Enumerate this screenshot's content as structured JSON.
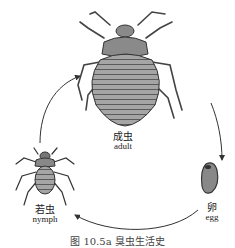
{
  "figure": {
    "caption": "图 10.5a   臭虫生活史",
    "stages": [
      {
        "id": "adult",
        "label_zh": "成虫",
        "label_en": "adult"
      },
      {
        "id": "egg",
        "label_zh": "卵",
        "label_en": "egg"
      },
      {
        "id": "nymph",
        "label_zh": "若虫",
        "label_en": "nymph"
      }
    ],
    "cycle_order": [
      "nymph",
      "adult",
      "egg",
      "nymph"
    ],
    "colors": {
      "line": "#333333",
      "body_fill": "#9a9a9a",
      "stripe": "#555555"
    }
  }
}
